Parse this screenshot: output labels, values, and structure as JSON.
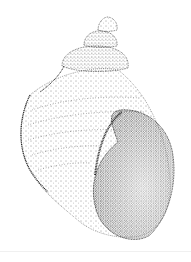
{
  "figure": {
    "colors": {
      "background": "#ffffff",
      "ink": "#1a1a1a"
    }
  }
}
